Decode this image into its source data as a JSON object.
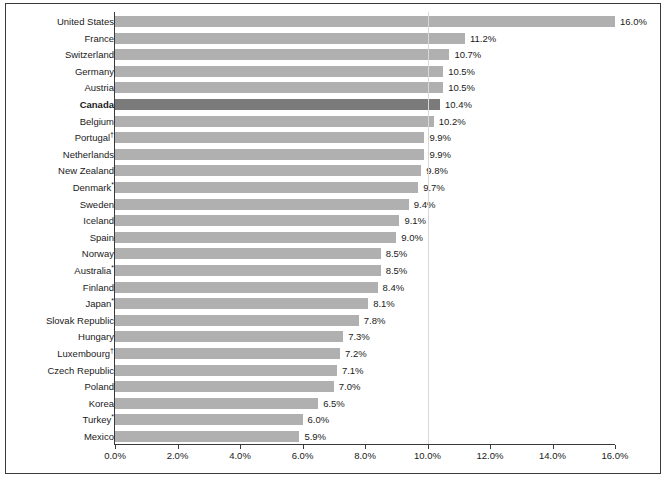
{
  "chart_data": {
    "type": "bar",
    "orientation": "horizontal",
    "title": "",
    "subtitle": "",
    "xlabel": "",
    "ylabel": "",
    "xlim": [
      0,
      16
    ],
    "ylim": null,
    "grid": true,
    "gridlines_x": [
      10.0
    ],
    "legend": null,
    "legend_position": "none",
    "value_format": "percent_one_decimal",
    "highlight_category": "Canada",
    "colors": {
      "bar": "#b0b0b0",
      "bar_highlight": "#7b7b7b",
      "axis": "#3a3a3a",
      "gridline": "#d8d8d8",
      "text": "#1a1a1a",
      "frame": "#3a3a3a",
      "background": "#ffffff"
    },
    "xticks": [
      {
        "value": 0.0,
        "label": "0.0%"
      },
      {
        "value": 2.0,
        "label": "2.0%"
      },
      {
        "value": 4.0,
        "label": "4.0%"
      },
      {
        "value": 6.0,
        "label": "6.0%"
      },
      {
        "value": 8.0,
        "label": "8.0%"
      },
      {
        "value": 10.0,
        "label": "10.0%"
      },
      {
        "value": 12.0,
        "label": "12.0%"
      },
      {
        "value": 14.0,
        "label": "14.0%"
      },
      {
        "value": 16.0,
        "label": "16.0%"
      }
    ],
    "categories": [
      "United States",
      "France",
      "Switzerland",
      "Germany",
      "Austria",
      "Canada",
      "Belgium",
      "Portugal†",
      "Netherlands",
      "New Zealand",
      "Denmark*",
      "Sweden",
      "Iceland",
      "Spain",
      "Norway",
      "Australia*",
      "Finland",
      "Japan*",
      "Slovak Republic",
      "Hungary",
      "Luxembourg†",
      "Czech Republic",
      "Poland",
      "Korea",
      "Turkey*",
      "Mexico"
    ],
    "values": [
      16.0,
      11.2,
      10.7,
      10.5,
      10.5,
      10.4,
      10.2,
      9.9,
      9.9,
      9.8,
      9.7,
      9.4,
      9.1,
      9.0,
      8.5,
      8.5,
      8.4,
      8.1,
      7.8,
      7.3,
      7.2,
      7.1,
      7.0,
      6.5,
      6.0,
      5.9
    ],
    "value_labels": [
      "16.0%",
      "11.2%",
      "10.7%",
      "10.5%",
      "10.5%",
      "10.4%",
      "10.2%",
      "9.9%",
      "9.9%",
      "9.8%",
      "9.7%",
      "9.4%",
      "9.1%",
      "9.0%",
      "8.5%",
      "8.5%",
      "8.4%",
      "8.1%",
      "7.8%",
      "7.3%",
      "7.2%",
      "7.1%",
      "7.0%",
      "6.5%",
      "6.0%",
      "5.9%"
    ],
    "rows": [
      {
        "category": "United States",
        "label": "United States",
        "sup": "",
        "value": 16.0,
        "value_label": "16.0%",
        "highlight": false
      },
      {
        "category": "France",
        "label": "France",
        "sup": "",
        "value": 11.2,
        "value_label": "11.2%",
        "highlight": false
      },
      {
        "category": "Switzerland",
        "label": "Switzerland",
        "sup": "",
        "value": 10.7,
        "value_label": "10.7%",
        "highlight": false
      },
      {
        "category": "Germany",
        "label": "Germany",
        "sup": "",
        "value": 10.5,
        "value_label": "10.5%",
        "highlight": false
      },
      {
        "category": "Austria",
        "label": "Austria",
        "sup": "",
        "value": 10.5,
        "value_label": "10.5%",
        "highlight": false
      },
      {
        "category": "Canada",
        "label": "Canada",
        "sup": "",
        "value": 10.4,
        "value_label": "10.4%",
        "highlight": true
      },
      {
        "category": "Belgium",
        "label": "Belgium",
        "sup": "",
        "value": 10.2,
        "value_label": "10.2%",
        "highlight": false
      },
      {
        "category": "Portugal",
        "label": "Portugal",
        "sup": "†",
        "value": 9.9,
        "value_label": "9.9%",
        "highlight": false
      },
      {
        "category": "Netherlands",
        "label": "Netherlands",
        "sup": "",
        "value": 9.9,
        "value_label": "9.9%",
        "highlight": false
      },
      {
        "category": "New Zealand",
        "label": "New Zealand",
        "sup": "",
        "value": 9.8,
        "value_label": "9.8%",
        "highlight": false
      },
      {
        "category": "Denmark",
        "label": "Denmark",
        "sup": "*",
        "value": 9.7,
        "value_label": "9.7%",
        "highlight": false
      },
      {
        "category": "Sweden",
        "label": "Sweden",
        "sup": "",
        "value": 9.4,
        "value_label": "9.4%",
        "highlight": false
      },
      {
        "category": "Iceland",
        "label": "Iceland",
        "sup": "",
        "value": 9.1,
        "value_label": "9.1%",
        "highlight": false
      },
      {
        "category": "Spain",
        "label": "Spain",
        "sup": "",
        "value": 9.0,
        "value_label": "9.0%",
        "highlight": false
      },
      {
        "category": "Norway",
        "label": "Norway",
        "sup": "",
        "value": 8.5,
        "value_label": "8.5%",
        "highlight": false
      },
      {
        "category": "Australia",
        "label": "Australia",
        "sup": "*",
        "value": 8.5,
        "value_label": "8.5%",
        "highlight": false
      },
      {
        "category": "Finland",
        "label": "Finland",
        "sup": "",
        "value": 8.4,
        "value_label": "8.4%",
        "highlight": false
      },
      {
        "category": "Japan",
        "label": "Japan",
        "sup": "*",
        "value": 8.1,
        "value_label": "8.1%",
        "highlight": false
      },
      {
        "category": "Slovak Republic",
        "label": "Slovak Republic",
        "sup": "",
        "value": 7.8,
        "value_label": "7.8%",
        "highlight": false
      },
      {
        "category": "Hungary",
        "label": "Hungary",
        "sup": "",
        "value": 7.3,
        "value_label": "7.3%",
        "highlight": false
      },
      {
        "category": "Luxembourg",
        "label": "Luxembourg",
        "sup": "†",
        "value": 7.2,
        "value_label": "7.2%",
        "highlight": false
      },
      {
        "category": "Czech Republic",
        "label": "Czech Republic",
        "sup": "",
        "value": 7.1,
        "value_label": "7.1%",
        "highlight": false
      },
      {
        "category": "Poland",
        "label": "Poland",
        "sup": "",
        "value": 7.0,
        "value_label": "7.0%",
        "highlight": false
      },
      {
        "category": "Korea",
        "label": "Korea",
        "sup": "",
        "value": 6.5,
        "value_label": "6.5%",
        "highlight": false
      },
      {
        "category": "Turkey",
        "label": "Turkey",
        "sup": "*",
        "value": 6.0,
        "value_label": "6.0%",
        "highlight": false
      },
      {
        "category": "Mexico",
        "label": "Mexico",
        "sup": "",
        "value": 5.9,
        "value_label": "5.9%",
        "highlight": false
      }
    ]
  }
}
